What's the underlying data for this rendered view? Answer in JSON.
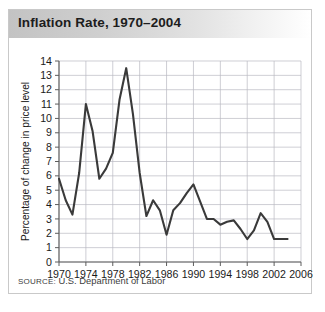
{
  "figure": {
    "title": "Inflation Rate, 1970–2004",
    "source_label": "SOURCE:",
    "source_text": "U.S. Department of Labor",
    "frame_color": "#c9c9c9",
    "header_gradient_start": "#c3c3c3",
    "header_gradient_end": "#ffffff"
  },
  "chart_data": {
    "type": "line",
    "title": "Inflation Rate, 1970–2004",
    "xlabel": "",
    "ylabel": "Percentage of change in price level",
    "xlim": [
      1970,
      2006
    ],
    "ylim": [
      0,
      14
    ],
    "grid": true,
    "legend": false,
    "line_color": "#3a3a3a",
    "xticks": [
      1970,
      1974,
      1978,
      1982,
      1986,
      1990,
      1994,
      1998,
      2002,
      2006
    ],
    "yticks": [
      0,
      1,
      2,
      3,
      4,
      5,
      6,
      7,
      8,
      9,
      10,
      11,
      12,
      13,
      14
    ],
    "x": [
      1970,
      1971,
      1972,
      1973,
      1974,
      1975,
      1976,
      1977,
      1978,
      1979,
      1980,
      1981,
      1982,
      1983,
      1984,
      1985,
      1986,
      1987,
      1988,
      1989,
      1990,
      1991,
      1992,
      1993,
      1994,
      1995,
      1996,
      1997,
      1998,
      1999,
      2000,
      2001,
      2002,
      2003,
      2004
    ],
    "values": [
      5.8,
      4.3,
      3.3,
      6.2,
      11.0,
      9.1,
      5.8,
      6.5,
      7.6,
      11.3,
      13.5,
      10.3,
      6.2,
      3.2,
      4.3,
      3.6,
      1.9,
      3.6,
      4.1,
      4.8,
      5.4,
      4.2,
      3.0,
      3.0,
      2.6,
      2.8,
      2.9,
      2.3,
      1.6,
      2.2,
      3.4,
      2.8,
      1.6,
      1.6,
      1.6
    ]
  }
}
